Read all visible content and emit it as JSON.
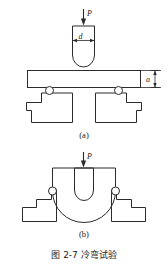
{
  "figure": {
    "caption": "图 2-7  冷弯试验",
    "caption_number": "图 2-7",
    "caption_title": "冷弯试验",
    "background_color": "#ffffff",
    "line_color": "#2b2b2b"
  },
  "panels": [
    {
      "id": "a",
      "label": "(a)",
      "description": "before bending",
      "load_label": "P",
      "punch_diameter_label": "d",
      "thickness_label": "a"
    },
    {
      "id": "b",
      "label": "(b)",
      "description": "after bending",
      "load_label": "P"
    }
  ],
  "annotations": {
    "load_arrow_a": "P",
    "punch_width_a": "d",
    "specimen_thickness_a": "a",
    "load_arrow_b": "P"
  },
  "icons": {
    "arrow_down": "down-arrow-icon",
    "roller": "roller-circle-icon"
  }
}
